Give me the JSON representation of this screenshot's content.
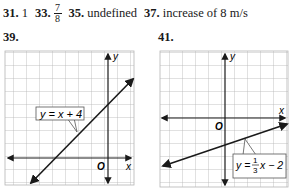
{
  "answers": [
    {
      "num": "31.",
      "text": "1"
    },
    {
      "num": "33.",
      "numerator": "7",
      "denominator": "8"
    },
    {
      "num": "35.",
      "text": "undefined"
    },
    {
      "num": "37.",
      "text": "increase of 8 m/s"
    }
  ],
  "graphs": [
    {
      "problem": "39.",
      "equation": "y = x + 4",
      "x_axis_label": "x",
      "y_axis_label": "y",
      "origin_label": "O"
    },
    {
      "problem": "41.",
      "equation_prefix": "y =",
      "equation_numerator": "1",
      "equation_denominator": "3",
      "equation_suffix": "x − 2",
      "x_axis_label": "x",
      "y_axis_label": "y",
      "origin_label": "O"
    }
  ]
}
